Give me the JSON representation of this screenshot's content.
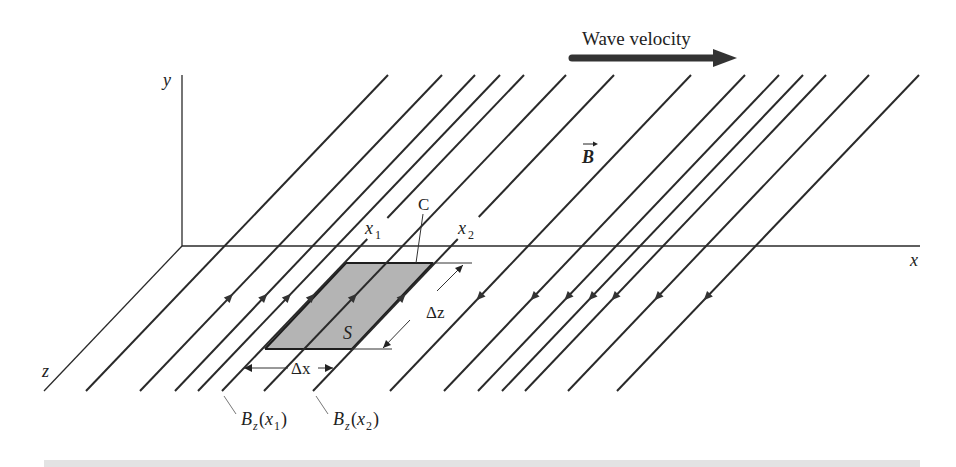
{
  "figure": {
    "title_arrow_label": "Wave velocity",
    "field_vector_label": "B",
    "axes": {
      "x": "x",
      "y": "y",
      "z": "z"
    },
    "surface_label": "S",
    "contour_label": "C",
    "position_labels": {
      "x1": "x",
      "x1_sub": "1",
      "x2": "x",
      "x2_sub": "2"
    },
    "delta_x_label": "Δx",
    "delta_z_label": "Δz",
    "field_labels": [
      {
        "main": "B",
        "sub": "z",
        "arg": "x",
        "arg_sub": "1"
      },
      {
        "main": "B",
        "sub": "z",
        "arg": "x",
        "arg_sub": "2"
      }
    ],
    "field_lines_count": 14,
    "field_direction_left_group": "+z",
    "field_direction_right_group": "-z",
    "colors": {
      "line": "#2a2a2a",
      "surface_fill": "#b4b4b4",
      "arrow": "#333333",
      "bottom_bar": "#e3e3e3"
    }
  }
}
